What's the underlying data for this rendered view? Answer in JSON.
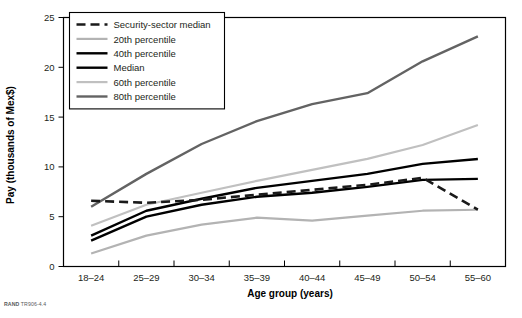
{
  "chart_data": {
    "type": "line",
    "title": "",
    "xlabel": "Age group (years)",
    "ylabel": "Pay (thousands of Mex$)",
    "categories": [
      "18–24",
      "25–29",
      "30–34",
      "35–39",
      "40–44",
      "45–49",
      "50–54",
      "55–60"
    ],
    "ylim": [
      0,
      25
    ],
    "yticks": [
      0,
      5,
      10,
      15,
      20,
      25
    ],
    "yticklabels": [
      "0",
      "5",
      "10",
      "15",
      "20",
      "25"
    ],
    "grid": false,
    "legend_position": "upper-left-inside",
    "series": [
      {
        "name": "Security-sector median",
        "style": "dashed",
        "color": "#1a1a1a",
        "width": 2.6,
        "values": [
          6.6,
          6.4,
          6.7,
          7.2,
          7.7,
          8.2,
          8.9,
          5.7
        ]
      },
      {
        "name": "20th percentile",
        "style": "solid",
        "color": "#b3b3b3",
        "width": 2.2,
        "values": [
          1.3,
          3.1,
          4.2,
          4.9,
          4.6,
          5.1,
          5.6,
          5.7
        ]
      },
      {
        "name": "40th percentile",
        "style": "solid",
        "color": "#000000",
        "width": 2.4,
        "values": [
          2.6,
          5.0,
          6.2,
          7.0,
          7.4,
          8.0,
          8.7,
          8.8
        ]
      },
      {
        "name": "Median",
        "style": "solid",
        "color": "#000000",
        "width": 2.4,
        "values": [
          3.1,
          5.6,
          6.8,
          7.9,
          8.6,
          9.3,
          10.3,
          10.8
        ]
      },
      {
        "name": "60th percentile",
        "style": "solid",
        "color": "#c0c0c0",
        "width": 2.2,
        "values": [
          4.1,
          6.2,
          7.4,
          8.6,
          9.7,
          10.8,
          12.2,
          14.2
        ]
      },
      {
        "name": "80th percentile",
        "style": "solid",
        "color": "#636363",
        "width": 2.4,
        "values": [
          6.0,
          9.3,
          12.3,
          14.6,
          16.3,
          17.4,
          20.6,
          23.1
        ]
      }
    ]
  },
  "footer": {
    "source_prefix": "RAND",
    "source_id": "TR906-4.4"
  }
}
